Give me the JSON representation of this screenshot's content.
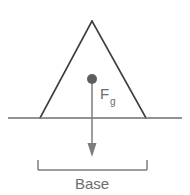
{
  "figure": {
    "background_color": "#ffffff",
    "width": 190,
    "height": 195,
    "colors": {
      "outline": "#3f3f3f",
      "ground": "#6f6f6f",
      "vector": "#7d7d7d",
      "center_of_mass": "#5e5e5e",
      "dimension": "#7d7d7d",
      "text": "#6d6d6d"
    },
    "shape": {
      "name": "triangle",
      "apex": {
        "x": 92,
        "y": 21
      },
      "base_left": {
        "x": 40,
        "y": 118
      },
      "base_right": {
        "x": 146,
        "y": 118
      }
    },
    "ground_line": {
      "x_start": 8,
      "x_end": 182,
      "y": 118
    },
    "center_of_mass_dot": {
      "x": 92,
      "y": 79,
      "radius": 5
    },
    "force_vector": {
      "label_symbol": "F",
      "label_subscript": "g",
      "label_full": "Fg",
      "direction": "down",
      "x": 92,
      "y_start": 79,
      "y_end": 157,
      "label_x": 100,
      "label_y": 99
    },
    "base_dimension": {
      "label": "Base",
      "x_left": 38,
      "x_right": 147,
      "y_line": 170,
      "tick_height": 10,
      "label_x": 92,
      "label_y": 189
    }
  }
}
